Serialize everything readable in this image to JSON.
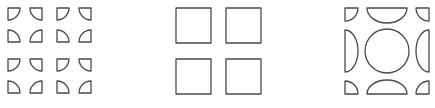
{
  "diagram": {
    "stroke_color": "#4a4a4a",
    "background_color": "#ffffff",
    "panels": [
      {
        "id": "quarter-pieces",
        "label": "",
        "pieces": 16,
        "piece_shape": "quarter-disk",
        "piece_size": 12,
        "columns_x": [
          8,
          30,
          57,
          79
        ],
        "rows_y": [
          8,
          30,
          59,
          81
        ]
      },
      {
        "id": "four-squares",
        "label": "",
        "squares": [
          {
            "x": 176,
            "y": 8,
            "size": 35
          },
          {
            "x": 226,
            "y": 8,
            "size": 35
          },
          {
            "x": 176,
            "y": 59,
            "size": 35
          },
          {
            "x": 226,
            "y": 59,
            "size": 35
          }
        ]
      },
      {
        "id": "circle-composition",
        "label": "",
        "circle": {
          "cx": 387,
          "cy": 51,
          "r": 22
        },
        "half_disks": [
          {
            "side": "top",
            "x1": 367,
            "x2": 407,
            "y": 8,
            "depth": 15
          },
          {
            "side": "bottom",
            "x1": 367,
            "x2": 407,
            "y": 94,
            "depth": 14
          },
          {
            "side": "left",
            "x": 345,
            "y1": 30,
            "y2": 72,
            "depth": 13
          },
          {
            "side": "right",
            "x": 429,
            "y1": 30,
            "y2": 72,
            "depth": 13
          }
        ],
        "corner_quarters": [
          {
            "corner": "top-left",
            "x": 345,
            "y": 8,
            "size": 13
          },
          {
            "corner": "top-right",
            "x": 416,
            "y": 8,
            "size": 13
          },
          {
            "corner": "bottom-left",
            "x": 345,
            "y": 81,
            "size": 13
          },
          {
            "corner": "bottom-right",
            "x": 416,
            "y": 81,
            "size": 13
          }
        ]
      }
    ]
  }
}
